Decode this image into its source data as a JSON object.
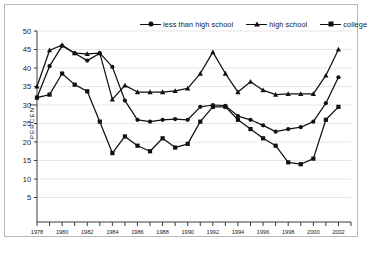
{
  "chart_data": {
    "type": "line",
    "title": "",
    "xlabel": "",
    "ylabel": "PERCENT",
    "xlim": [
      1978,
      2003
    ],
    "ylim": [
      0,
      50
    ],
    "ytick_step": 5,
    "yticks": [
      5,
      10,
      15,
      20,
      25,
      30,
      35,
      40,
      45,
      50
    ],
    "xticks": [
      1978,
      1979,
      1980,
      1981,
      1982,
      1983,
      1984,
      1985,
      1986,
      1987,
      1988,
      1989,
      1990,
      1991,
      1992,
      1993,
      1994,
      1995,
      1996,
      1997,
      1998,
      1999,
      2000,
      2001,
      2002,
      2003
    ],
    "xtick_labels": [
      "1978",
      "",
      "1980",
      "",
      "1982",
      "",
      "1984",
      "",
      "1986",
      "",
      "1988",
      "",
      "1990",
      "",
      "1992",
      "",
      "1994",
      "",
      "1996",
      "",
      "1998",
      "",
      "2000",
      "",
      "2002",
      ""
    ],
    "grid": "horizontal",
    "legend_position": "top",
    "x": [
      1978,
      1979,
      1980,
      1981,
      1982,
      1983,
      1984,
      1985,
      1986,
      1987,
      1988,
      1989,
      1990,
      1991,
      1992,
      1993,
      1994,
      1995,
      1996,
      1997,
      1998,
      1999,
      2000,
      2001,
      2002
    ],
    "series": [
      {
        "name": "less than high school",
        "marker": "circle",
        "color": "#111114",
        "values": [
          32.0,
          40.5,
          46.0,
          44.0,
          42.0,
          44.0,
          40.3,
          31.2,
          26.0,
          25.5,
          26.0,
          26.2,
          26.0,
          29.5,
          30.0,
          29.8,
          27.0,
          26.0,
          24.5,
          22.8,
          23.5,
          24.0,
          25.5,
          30.5,
          37.5
        ]
      },
      {
        "name": "high school",
        "marker": "triangle",
        "color": "#111114",
        "values": [
          35.0,
          44.8,
          46.2,
          44.0,
          43.8,
          44.0,
          31.5,
          35.3,
          33.5,
          33.5,
          33.5,
          33.8,
          34.5,
          38.5,
          44.3,
          38.5,
          33.5,
          36.3,
          34.0,
          32.8,
          33.0,
          33.0,
          33.0,
          38.0,
          45.0
        ]
      },
      {
        "name": "college",
        "marker": "square",
        "color": "#111114",
        "values": [
          32.0,
          32.8,
          38.5,
          35.5,
          33.7,
          25.5,
          17.0,
          21.5,
          19.0,
          17.5,
          21.0,
          18.5,
          19.5,
          25.5,
          29.5,
          29.5,
          26.0,
          23.5,
          21.0,
          19.0,
          14.5,
          14.0,
          15.5,
          26.0,
          29.5
        ]
      }
    ]
  },
  "legend": {
    "items": [
      {
        "label": "less than high school",
        "marker": "circle"
      },
      {
        "label": "high school",
        "marker": "triangle"
      },
      {
        "label": "college",
        "marker": "square"
      }
    ]
  }
}
